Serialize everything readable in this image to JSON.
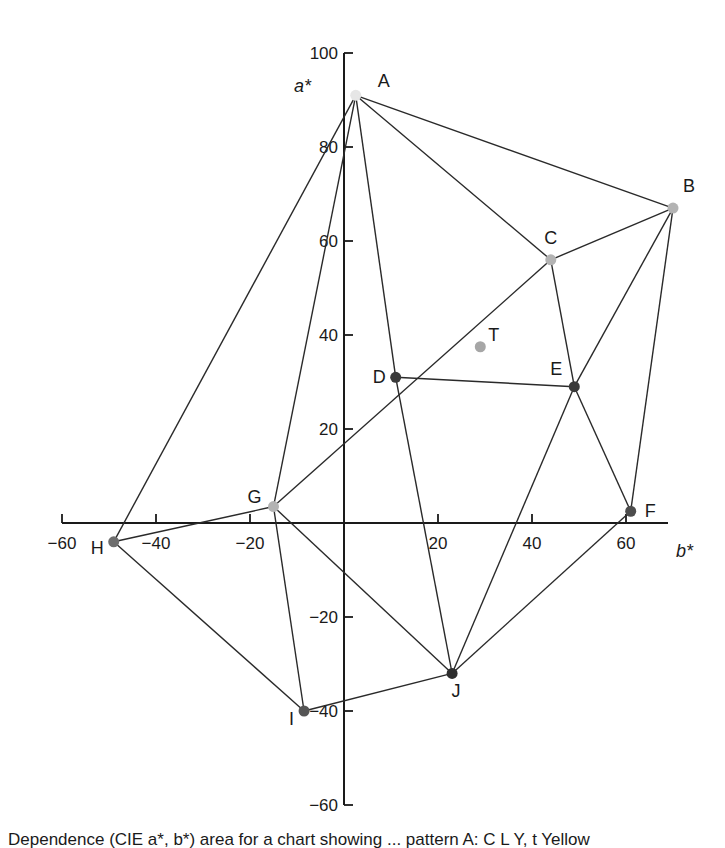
{
  "chart_data": {
    "type": "scatter",
    "title": "",
    "xlabel": "b*",
    "ylabel": "a*",
    "xlim": [
      -60,
      70
    ],
    "ylim": [
      -60,
      100
    ],
    "x_ticks": [
      -60,
      -40,
      -20,
      20,
      40,
      60
    ],
    "y_ticks": [
      100,
      80,
      60,
      40,
      20,
      -20,
      -40,
      -60
    ],
    "grid": false,
    "legend": null,
    "points": [
      {
        "label": "A",
        "b": 2.5,
        "a": 91,
        "color": "#e6e6e6"
      },
      {
        "label": "B",
        "b": 70,
        "a": 67,
        "color": "#b3b3b3"
      },
      {
        "label": "C",
        "b": 44,
        "a": 56,
        "color": "#b3b3b3"
      },
      {
        "label": "D",
        "b": 11,
        "a": 31,
        "color": "#3a3a3a"
      },
      {
        "label": "E",
        "b": 49,
        "a": 29,
        "color": "#3a3a3a"
      },
      {
        "label": "F",
        "b": 61,
        "a": 2.5,
        "color": "#4d4d4d"
      },
      {
        "label": "G",
        "b": -15,
        "a": 3.5,
        "color": "#b3b3b3"
      },
      {
        "label": "H",
        "b": -49,
        "a": -4,
        "color": "#6e6e6e"
      },
      {
        "label": "I",
        "b": -8.5,
        "a": -40,
        "color": "#555555"
      },
      {
        "label": "J",
        "b": 23,
        "a": -32,
        "color": "#2e2e2e"
      },
      {
        "label": "T",
        "b": 29,
        "a": 37.5,
        "color": "#a6a6a6"
      }
    ],
    "edges": [
      [
        "A",
        "B"
      ],
      [
        "A",
        "C"
      ],
      [
        "A",
        "D"
      ],
      [
        "A",
        "G"
      ],
      [
        "A",
        "H"
      ],
      [
        "B",
        "C"
      ],
      [
        "B",
        "E"
      ],
      [
        "B",
        "F"
      ],
      [
        "C",
        "E"
      ],
      [
        "C",
        "G"
      ],
      [
        "D",
        "E"
      ],
      [
        "D",
        "J"
      ],
      [
        "E",
        "F"
      ],
      [
        "E",
        "J"
      ],
      [
        "F",
        "J"
      ],
      [
        "G",
        "H"
      ],
      [
        "G",
        "I"
      ],
      [
        "G",
        "J"
      ],
      [
        "H",
        "I"
      ],
      [
        "I",
        "J"
      ]
    ]
  },
  "caption": {
    "text": "Dependence (CIE a*, b*) area for a chart showing ... pattern A: C L Y, t Yellow"
  }
}
